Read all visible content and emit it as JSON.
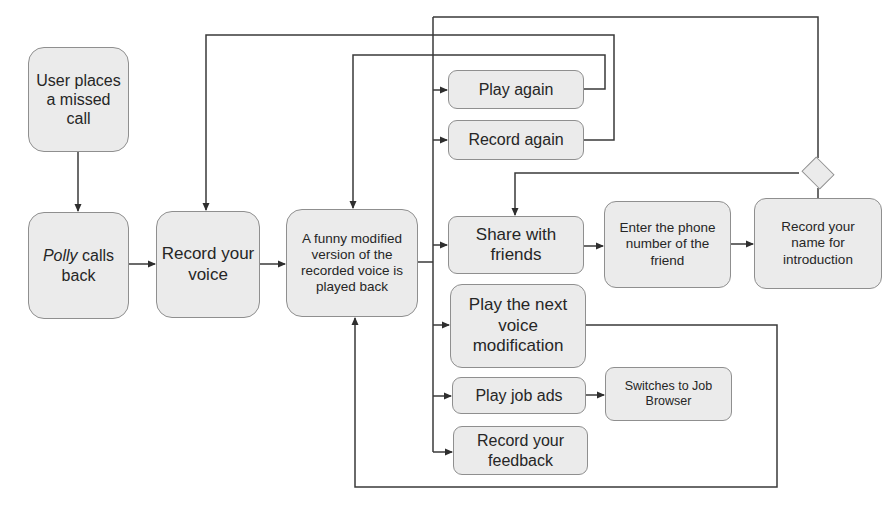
{
  "diagram": {
    "type": "flowchart",
    "nodes": {
      "missed_call": {
        "label": "User places a missed call"
      },
      "polly_calls_back": {
        "label_italic": "Polly",
        "label_rest": " calls back"
      },
      "record_voice": {
        "label": "Record your voice"
      },
      "funny_playback": {
        "label": "A funny modified version of the recorded voice is played back"
      },
      "play_again": {
        "label": "Play again"
      },
      "record_again": {
        "label": "Record again"
      },
      "share_friends": {
        "label": "Share with friends"
      },
      "enter_phone": {
        "label": "Enter the phone number of the friend"
      },
      "record_name": {
        "label": "Record your name for introduction"
      },
      "decision": {
        "label": ""
      },
      "next_modification": {
        "label": "Play the next voice modification"
      },
      "play_job_ads": {
        "label": "Play job ads"
      },
      "job_browser": {
        "label": "Switches to Job Browser"
      },
      "record_feedback": {
        "label": "Record your feedback"
      }
    },
    "edges": [
      {
        "from": "missed_call",
        "to": "polly_calls_back"
      },
      {
        "from": "polly_calls_back",
        "to": "record_voice"
      },
      {
        "from": "record_voice",
        "to": "funny_playback"
      },
      {
        "from": "funny_playback",
        "to": "play_again"
      },
      {
        "from": "funny_playback",
        "to": "record_again"
      },
      {
        "from": "funny_playback",
        "to": "share_friends"
      },
      {
        "from": "funny_playback",
        "to": "next_modification"
      },
      {
        "from": "funny_playback",
        "to": "play_job_ads"
      },
      {
        "from": "funny_playback",
        "to": "record_feedback"
      },
      {
        "from": "play_again",
        "to": "funny_playback"
      },
      {
        "from": "record_again",
        "to": "record_voice"
      },
      {
        "from": "share_friends",
        "to": "enter_phone"
      },
      {
        "from": "enter_phone",
        "to": "record_name"
      },
      {
        "from": "record_name",
        "to": "decision"
      },
      {
        "from": "decision",
        "to": "share_friends"
      },
      {
        "from": "decision",
        "to": "funny_playback_branch"
      },
      {
        "from": "next_modification",
        "to": "funny_playback"
      },
      {
        "from": "play_job_ads",
        "to": "job_browser"
      }
    ],
    "colors": {
      "node_fill": "#ebebeb",
      "node_border": "#8f8f8f",
      "line": "#3a3a3a",
      "text": "#262626"
    }
  }
}
